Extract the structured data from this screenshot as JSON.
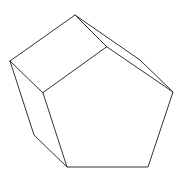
{
  "figure": {
    "shape": "pentagonal-prism",
    "stroke_color": "#333333",
    "background_color": "#ffffff"
  },
  "caption": {
    "text": ""
  }
}
